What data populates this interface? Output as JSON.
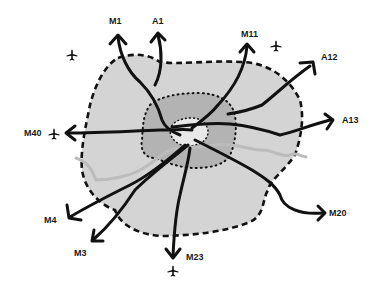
{
  "diagram": {
    "type": "road-network-map",
    "colors": {
      "outer_area": "#d4d4d4",
      "inner_area": "#b3b3b3",
      "core": "#e8e8e8",
      "roads": "#111111",
      "river": "#bcbcbc",
      "boundary": "#111111"
    },
    "roads": [
      {
        "id": "M1",
        "label": "M1",
        "direction": "north"
      },
      {
        "id": "A1",
        "label": "A1",
        "direction": "north"
      },
      {
        "id": "M11",
        "label": "M11",
        "direction": "north-east"
      },
      {
        "id": "A12",
        "label": "A12",
        "direction": "east-north-east"
      },
      {
        "id": "A13",
        "label": "A13",
        "direction": "east"
      },
      {
        "id": "M20",
        "label": "M20",
        "direction": "south-east"
      },
      {
        "id": "M23",
        "label": "M23",
        "direction": "south"
      },
      {
        "id": "M3",
        "label": "M3",
        "direction": "south-west"
      },
      {
        "id": "M4",
        "label": "M4",
        "direction": "west-south-west"
      },
      {
        "id": "M40",
        "label": "M40",
        "direction": "west"
      }
    ],
    "airports": [
      {
        "id": "airport-northwest",
        "icon": "airplane-icon"
      },
      {
        "id": "airport-northeast",
        "icon": "airplane-icon"
      },
      {
        "id": "airport-west",
        "icon": "airplane-icon"
      },
      {
        "id": "airport-south",
        "icon": "airplane-icon"
      }
    ],
    "legend_regions": [
      "outer-boundary",
      "inner-zone",
      "central-core",
      "river"
    ]
  }
}
